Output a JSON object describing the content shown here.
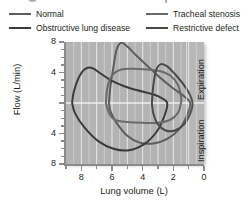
{
  "legend": {
    "items": [
      {
        "label": "Normal",
        "color": "#5d5d5d",
        "icon": "line-swatch"
      },
      {
        "label": "Obstructive lung disease",
        "color": "#3a3a3a",
        "icon": "line-swatch"
      },
      {
        "label": "Tracheal stenosis",
        "color": "#6b6b6b",
        "icon": "line-swatch"
      },
      {
        "label": "Restrictive defect",
        "color": "#4a4a4a",
        "icon": "line-swatch"
      }
    ]
  },
  "axes": {
    "y_title": "Flow (L/min)",
    "x_title": "Lung volume (L)",
    "y_ticks": [
      "8",
      "4",
      "",
      "4",
      "8"
    ],
    "x_ticks": [
      "8",
      "6",
      "4",
      "2",
      "0"
    ]
  },
  "phases": {
    "expiration": "Expiration",
    "inspiration": "Inspiration"
  },
  "style": {
    "plot_background": "#b3b3b3",
    "gridline_color": "#e8e8e8",
    "axis_color": "#8b8b8b",
    "text_color": "#231f20"
  },
  "chart_data": {
    "type": "line",
    "title": "",
    "xlabel": "Lung volume (L)",
    "ylabel": "Flow (L/min)",
    "xlim": [
      9,
      0
    ],
    "ylim": [
      -8,
      8
    ],
    "x_reversed": true,
    "grid": "vertical white gridlines at every 0.5 L; white zero-flow midline",
    "legend_position": "above-plot",
    "annotations": [
      "Expiration (upper half)",
      "Inspiration (lower half)"
    ],
    "series": [
      {
        "name": "Normal",
        "color": "#5d5d5d",
        "description": "Flow-volume loop with rapid rise to peak expiratory flow ~8 L/min near TLC then near-linear descent to RV; rounded inspiratory limb to ~-5 L/min",
        "points": [
          [
            6.2,
            0.0
          ],
          [
            6.1,
            2.2
          ],
          [
            5.9,
            4.8
          ],
          [
            5.7,
            7.0
          ],
          [
            5.4,
            7.9
          ],
          [
            5.0,
            7.4
          ],
          [
            4.4,
            6.2
          ],
          [
            3.6,
            4.7
          ],
          [
            2.8,
            3.2
          ],
          [
            2.0,
            1.9
          ],
          [
            1.3,
            0.9
          ],
          [
            0.9,
            0.0
          ],
          [
            1.1,
            -1.6
          ],
          [
            1.6,
            -3.4
          ],
          [
            2.4,
            -4.7
          ],
          [
            3.3,
            -5.3
          ],
          [
            4.2,
            -5.2
          ],
          [
            5.0,
            -4.3
          ],
          [
            5.7,
            -2.6
          ],
          [
            6.1,
            -1.1
          ],
          [
            6.2,
            0.0
          ]
        ]
      },
      {
        "name": "Obstructive lung disease",
        "color": "#3a3a3a",
        "description": "Large hyperinflated loop shifted to high lung volumes, peak expiratory flow ~4.5 L/min with scooped concave expiratory limb, deep inspiratory limb to ~-6 L/min",
        "points": [
          [
            8.6,
            0.0
          ],
          [
            8.5,
            1.4
          ],
          [
            8.2,
            3.2
          ],
          [
            7.8,
            4.4
          ],
          [
            7.3,
            4.6
          ],
          [
            6.7,
            3.8
          ],
          [
            6.0,
            2.9
          ],
          [
            5.2,
            2.2
          ],
          [
            4.4,
            1.7
          ],
          [
            3.6,
            1.3
          ],
          [
            2.9,
            0.8
          ],
          [
            2.4,
            0.0
          ],
          [
            2.6,
            -1.8
          ],
          [
            3.1,
            -3.8
          ],
          [
            3.9,
            -5.4
          ],
          [
            4.9,
            -6.2
          ],
          [
            5.9,
            -6.0
          ],
          [
            6.9,
            -5.0
          ],
          [
            7.8,
            -3.2
          ],
          [
            8.4,
            -1.4
          ],
          [
            8.6,
            0.0
          ]
        ]
      },
      {
        "name": "Tracheal stenosis",
        "color": "#6b6b6b",
        "description": "Flattened plateau on both expiratory and inspiratory limbs, flow capped near 4.5 L/min expiration and -2.5 L/min inspiration",
        "points": [
          [
            6.4,
            0.0
          ],
          [
            6.3,
            2.0
          ],
          [
            6.0,
            3.6
          ],
          [
            5.4,
            4.4
          ],
          [
            4.6,
            4.5
          ],
          [
            3.7,
            4.4
          ],
          [
            2.9,
            4.2
          ],
          [
            2.2,
            3.6
          ],
          [
            1.7,
            2.4
          ],
          [
            1.5,
            0.9
          ],
          [
            1.5,
            0.0
          ],
          [
            1.7,
            -1.3
          ],
          [
            2.2,
            -2.2
          ],
          [
            3.0,
            -2.6
          ],
          [
            4.0,
            -2.6
          ],
          [
            5.0,
            -2.5
          ],
          [
            5.8,
            -2.2
          ],
          [
            6.2,
            -1.3
          ],
          [
            6.4,
            0.0
          ]
        ]
      },
      {
        "name": "Restrictive defect",
        "color": "#4a4a4a",
        "description": "Narrow small-volume loop shifted toward low lung volumes, near-normal peak flow ~5 L/min over a reduced vital capacity",
        "points": [
          [
            3.4,
            0.0
          ],
          [
            3.3,
            2.4
          ],
          [
            3.1,
            4.4
          ],
          [
            2.8,
            5.1
          ],
          [
            2.4,
            4.8
          ],
          [
            1.9,
            3.8
          ],
          [
            1.4,
            2.6
          ],
          [
            1.0,
            1.4
          ],
          [
            0.75,
            0.0
          ],
          [
            0.9,
            -1.4
          ],
          [
            1.3,
            -2.8
          ],
          [
            1.9,
            -3.6
          ],
          [
            2.5,
            -3.6
          ],
          [
            3.0,
            -2.8
          ],
          [
            3.3,
            -1.4
          ],
          [
            3.4,
            0.0
          ]
        ]
      }
    ]
  }
}
